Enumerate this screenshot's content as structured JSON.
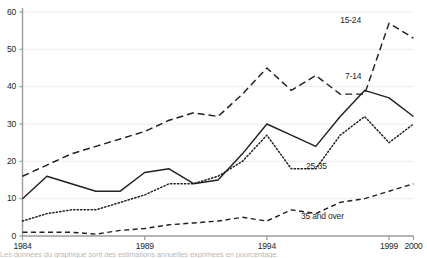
{
  "chart_data": {
    "type": "line",
    "title": "",
    "subtitle": "",
    "xlabel": "",
    "ylabel": "",
    "xlim": [
      1984,
      2000
    ],
    "ylim": [
      0,
      60
    ],
    "y_ticks": [
      0,
      10,
      20,
      30,
      40,
      50,
      60
    ],
    "x_ticks": [
      1984,
      1989,
      1994,
      1999,
      2000
    ],
    "x_tick_labels": [
      "1984",
      "1989",
      "1994",
      "1999",
      "2000"
    ],
    "y_tick_labels": [
      "0",
      "10",
      "20",
      "30",
      "40",
      "50",
      "60"
    ],
    "grid": true,
    "grid_axis": "y",
    "legend": "inline-labels",
    "x": [
      1984,
      1985,
      1986,
      1987,
      1988,
      1989,
      1990,
      1991,
      1992,
      1993,
      1994,
      1995,
      1996,
      1997,
      1998,
      1999,
      2000
    ],
    "series": [
      {
        "name": "15-24",
        "style": "long-dashed",
        "label": "15-24",
        "values": [
          16,
          19,
          22,
          24,
          26,
          28,
          31,
          33,
          32,
          38,
          45,
          39,
          43,
          38,
          38,
          57,
          53
        ],
        "label_x": 1997.0,
        "label_y": 57.5
      },
      {
        "name": "7-14",
        "style": "solid",
        "label": "7-14",
        "values": [
          10,
          16,
          14,
          12,
          12,
          17,
          18,
          14,
          15,
          22,
          30,
          27,
          24,
          32,
          39,
          37,
          32
        ],
        "label_x": 1997.2,
        "label_y": 42.5
      },
      {
        "name": "25-35",
        "style": "dotted",
        "label": "25-35",
        "values": [
          4,
          6,
          7,
          7,
          9,
          11,
          14,
          14,
          16,
          20,
          27,
          18,
          18,
          27,
          32,
          25,
          30
        ],
        "label_x": 1995.6,
        "label_y": 18.5
      },
      {
        "name": "35 and over",
        "style": "short-dashed",
        "label": "35 and over",
        "values": [
          1,
          1,
          1,
          0.5,
          1.5,
          2,
          3,
          3.5,
          4,
          5,
          4,
          7,
          6,
          9,
          10,
          12,
          14
        ],
        "label_x": 1995.4,
        "label_y": 5.0
      }
    ],
    "colors": {
      "line": "#231f20",
      "grid": "#ececee",
      "axis": "#9b9b9e",
      "text": "#231f20"
    }
  },
  "caption": {
    "text": "Les donnees du graphique sont des estimations annuelles exprimees en pourcentage."
  }
}
